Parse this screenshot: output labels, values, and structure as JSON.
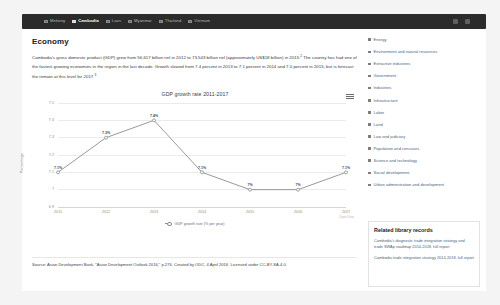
{
  "topnav": {
    "countries": [
      {
        "label": "Mekong",
        "active": false
      },
      {
        "label": "Cambodia",
        "active": true
      },
      {
        "label": "Laos",
        "active": false
      },
      {
        "label": "Myanmar",
        "active": false
      },
      {
        "label": "Thailand",
        "active": false
      },
      {
        "label": "Vietnam",
        "active": false
      }
    ],
    "right_icons": [
      "search-icon",
      "menu-icon"
    ]
  },
  "main": {
    "title": "Economy",
    "intro_part1": "Cambodia's gross domestic product (GDP) grew from 56,617 billion riel in 2012 to 73,543 billion riel (approximately US$18 billion) in 2015.",
    "intro_ref1": "2",
    "intro_part2": " The country has had one of the fastest growing economies in the region in the last decade. Growth slowed from 7.4 percent in 2013 to 7.1 percent in 2014 and 7.0 percent in 2015, but is forecast the remain at this level for 2017.",
    "intro_ref2": "3",
    "source": "Source: Asian Development Bank, \"Asian Development Outlook 2016,\" p.276. Created by ODC, 4 April 2016. Licensed under CC-BY-SA-4.0.",
    "chart_credit": "Open Data"
  },
  "chart_data": {
    "type": "line",
    "title": "GDP growth rate 2011-2017",
    "categories": [
      "2011",
      "2012",
      "2013",
      "2014",
      "2015",
      "2016",
      "2017"
    ],
    "values": [
      7.1,
      7.3,
      7.4,
      7.1,
      7.0,
      7.0,
      7.1
    ],
    "point_labels": [
      "7.1%",
      "7.3%",
      "7.4%",
      "7.1%",
      "7%",
      "7%",
      "7.1%"
    ],
    "ylabel": "Percentage",
    "xlabel": "",
    "ylim": [
      6.9,
      7.5
    ],
    "yticks": [
      "7.5",
      "7.4",
      "7.3",
      "7.2",
      "7.1",
      "7",
      "6.9"
    ],
    "ytick_values": [
      7.5,
      7.4,
      7.3,
      7.2,
      7.1,
      7.0,
      6.9
    ],
    "legend": [
      "GDP growth rate (% per year)"
    ],
    "legend_position": "bottom",
    "grid": true,
    "line_color": "#8d8d8d",
    "menu_icon": "hamburger-menu-icon"
  },
  "sidebar": {
    "topics": [
      "Energy",
      "Environment and natural resources",
      "Extractive industries",
      "Government",
      "Industries",
      "Infrastructure",
      "Labor",
      "Land",
      "Law and judiciary",
      "Population and censuses",
      "Science and technology",
      "Social development",
      "Urban administration and development"
    ],
    "related": {
      "title": "Related library records",
      "items": [
        "Cambodia's diagnostic trade integration strategy and trade SWAp roadmap 2014-2018, full report",
        "Cambodia trade integration strategy 2014-2018, full report"
      ]
    }
  },
  "colors": {
    "navbar": "#2b2b2b",
    "link": "#4b5f7a",
    "page_bg": "#f4f4f4"
  }
}
